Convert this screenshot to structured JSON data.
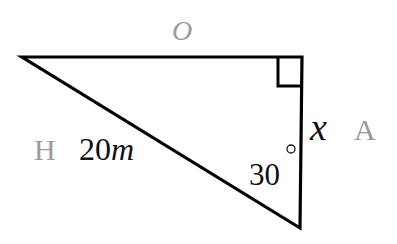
{
  "diagram": {
    "type": "right-triangle",
    "vertices": {
      "left": [
        22,
        57
      ],
      "right_angle": [
        302,
        57
      ],
      "bottom": [
        300,
        228
      ]
    },
    "right_angle_marker": true,
    "labels": {
      "opposite_side_label": "O",
      "hypotenuse_side_label": "H",
      "hypotenuse_length": "20",
      "hypotenuse_unit": "m",
      "adjacent_side_variable": "x",
      "adjacent_side_label": "A",
      "angle_value": "30",
      "angle_unit": "°"
    },
    "colors": {
      "line": "#000000",
      "side_name_labels": "#9a9a9a",
      "value_labels": "#111111"
    }
  }
}
